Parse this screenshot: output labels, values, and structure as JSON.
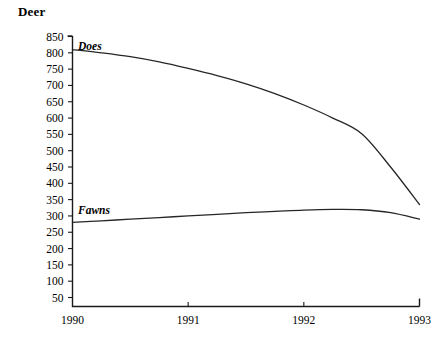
{
  "chart_data": {
    "type": "line",
    "title": "Deer",
    "xlabel": "",
    "ylabel": "",
    "grid": false,
    "legend_position": "inline-labels",
    "x": [
      1990,
      1991,
      1992,
      1993
    ],
    "xticklabels": [
      "1990",
      "1991",
      "1992",
      "1993"
    ],
    "xlim": [
      1990,
      1993
    ],
    "ylim": [
      0,
      875
    ],
    "yticks": [
      50,
      100,
      150,
      200,
      250,
      300,
      350,
      400,
      450,
      500,
      550,
      600,
      650,
      700,
      750,
      800,
      850
    ],
    "yticklabels": [
      "50",
      "100",
      "150",
      "200",
      "250",
      "300",
      "350",
      "400",
      "450",
      "500",
      "550",
      "600",
      "650",
      "700",
      "750",
      "800",
      "850"
    ],
    "series": [
      {
        "name": "Does",
        "label": "Does",
        "color": "#262626",
        "x": [
          1990,
          1990.25,
          1990.5,
          1990.75,
          1991,
          1991.25,
          1991.5,
          1991.75,
          1992,
          1992.25,
          1992.5,
          1992.75,
          1993
        ],
        "values": [
          810,
          800,
          788,
          772,
          752,
          730,
          705,
          675,
          640,
          600,
          552,
          450,
          335
        ]
      },
      {
        "name": "Fawns",
        "label": "Fawns",
        "color": "#262626",
        "x": [
          1990,
          1990.25,
          1990.5,
          1990.75,
          1991,
          1991.25,
          1991.5,
          1991.75,
          1992,
          1992.25,
          1992.5,
          1992.75,
          1993
        ],
        "values": [
          280,
          285,
          290,
          295,
          300,
          305,
          310,
          314,
          318,
          320,
          319,
          310,
          290
        ]
      }
    ]
  },
  "annotations": {
    "does_label": "Does",
    "fawns_label": "Fawns"
  }
}
